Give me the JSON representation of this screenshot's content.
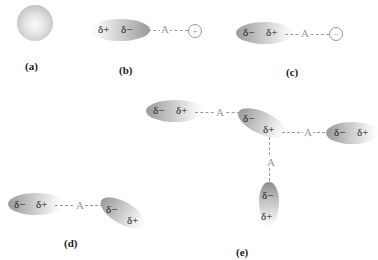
{
  "panels": {
    "a": {
      "caption": "(a)"
    },
    "b": {
      "caption": "(b)",
      "molecule": {
        "left": "δ+",
        "right": "δ−"
      },
      "atom": "A",
      "ion": "+"
    },
    "c": {
      "caption": "(c)",
      "molecule": {
        "left": "δ−",
        "right": "δ+"
      },
      "atom": "A",
      "ion": "−"
    },
    "d": {
      "caption": "(d)",
      "mol1": {
        "left": "δ−",
        "right": "δ+"
      },
      "atom": "A",
      "mol2": {
        "top": "δ−",
        "bottom": "δ+"
      }
    },
    "e": {
      "caption": "(e)",
      "left_mol": {
        "left": "δ−",
        "right": "δ+"
      },
      "center_mol": {
        "top": "δ−",
        "bottom": "δ+"
      },
      "right_mol": {
        "left": "δ−",
        "right": "δ+"
      },
      "bottom_mol": {
        "top": "δ−",
        "bottom": "δ+"
      },
      "atom_left": "A",
      "atom_right": "A",
      "atom_bottom": "A"
    }
  }
}
